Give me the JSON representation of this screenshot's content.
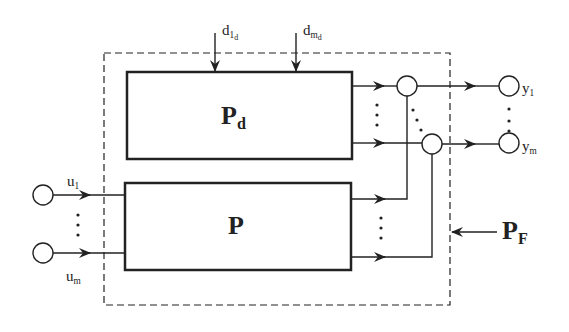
{
  "diagram": {
    "blocks": {
      "disturbance_plant": {
        "main": "P",
        "sub": "d"
      },
      "plant": {
        "main": "P"
      },
      "faulty_plant_boundary": {
        "main": "P",
        "sub": "F"
      }
    },
    "disturbances": [
      {
        "main": "d",
        "sub": "1",
        "subsub": "d"
      },
      {
        "main": "d",
        "sub": "m",
        "subsub": "d"
      }
    ],
    "inputs": [
      {
        "main": "u",
        "sub": "1"
      },
      {
        "main": "u",
        "sub": "m"
      }
    ],
    "outputs": [
      {
        "main": "y",
        "sub": "1"
      },
      {
        "main": "y",
        "sub": "m"
      }
    ],
    "colors": {
      "line": "#222222",
      "background": "#ffffff"
    }
  }
}
